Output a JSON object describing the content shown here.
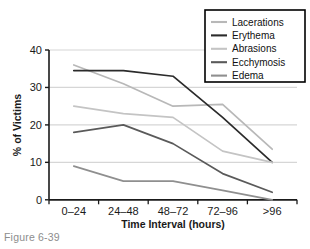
{
  "figure": {
    "caption": "Figure 6-39"
  },
  "chart_data": {
    "type": "line",
    "title": "",
    "xlabel": "Time Interval (hours)",
    "ylabel": "% of Victims",
    "categories": [
      "0–24",
      "24–48",
      "48–72",
      "72–96",
      ">96"
    ],
    "ylim": [
      0,
      40
    ],
    "yticks": [
      0,
      10,
      20,
      30,
      40
    ],
    "ytick_labels": [
      "0",
      "10",
      "20",
      "30",
      "40"
    ],
    "grid": "horizontal",
    "legend_position": "top-right",
    "series": [
      {
        "name": "Lacerations",
        "color": "#b8b8b8",
        "values": [
          36,
          31,
          25,
          25.5,
          13.5
        ]
      },
      {
        "name": "Erythema",
        "color": "#2b2b2b",
        "values": [
          34.5,
          34.5,
          33,
          22,
          10
        ]
      },
      {
        "name": "Abrasions",
        "color": "#c4c4c4",
        "values": [
          25,
          23,
          22,
          13,
          10
        ]
      },
      {
        "name": "Ecchymosis",
        "color": "#5a5a5a",
        "values": [
          18,
          20,
          15,
          7,
          2
        ]
      },
      {
        "name": "Edema",
        "color": "#8f8f8f",
        "values": [
          9,
          5,
          5,
          2.5,
          0
        ]
      }
    ]
  },
  "colors": {
    "axis": "#1a1a1a",
    "gridline": "#d6d6d6",
    "legend_border": "#000000",
    "caption": "#8d8d8d",
    "background": "#ffffff"
  }
}
